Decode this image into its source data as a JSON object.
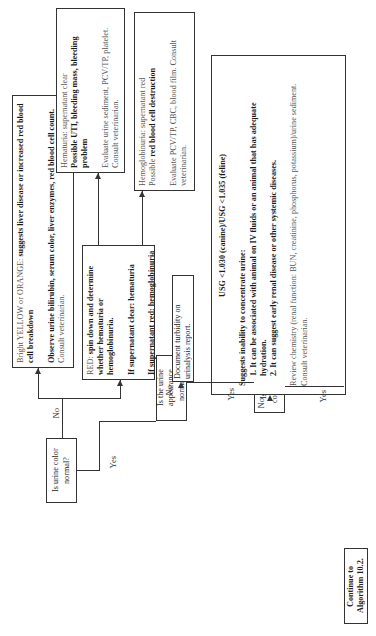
{
  "questions": {
    "q1": "Is urine color normal?",
    "q2": "Is the urine appearance normal?",
    "q3": "Is the urine concentrated?"
  },
  "labels": {
    "yes": "Yes",
    "no": "No"
  },
  "terminal": {
    "continue": "Continue to Algorithm 10.2."
  },
  "yellow_box": {
    "lead_plain": "Bright YELLOW or ORANGE: ",
    "lead_bold": "suggests liver disease or increased red blood cell breakdown",
    "action_bold": "Observe urine bilirubin, serum color, liver enzymes, red blood cell count.",
    "action_plain": " Consult veterinarian."
  },
  "red_box": {
    "lead_plain": "RED: ",
    "lead_bold": "spin down and determine whether hematuria or hemoglobinuria.",
    "clear": "If supernatant clear: hematuria",
    "red": "If supernatant red: hemoglobinuria"
  },
  "hematuria_box": {
    "line1": "Hematuria: supernatant clear",
    "line2_bold": "Possible UTI, bleeding mass, bleeding problem",
    "action": "Evaluate urine sediment, PCV/TP, platelet. Consult veterinarian."
  },
  "hemoglobinuria_box": {
    "line1": "Hemoglobinuria: supernatant red",
    "line2_plain": "Possible ",
    "line2_bold": "red blood cell destruction",
    "action": "Evaluate PCV/TP, CBC, blood film. Consult veterinarian."
  },
  "turbidity_box": {
    "text": "Document turbidity on urinalysis report."
  },
  "usg_box": {
    "title": "USG <1.030 (canine)/USG <1.035 (feline)",
    "intro": "Suggests inability to concentrate urine:",
    "point1": "1. It can be associated with animal on IV fluids or an animal that has adequate hydration.",
    "point2": "2. It can suggest early renal disease or other systemic diseases.",
    "action": "Review chemistry (renal function: BUN, creatinine, phosphorus, potassium)/urine sediment. Consult veterinarian."
  }
}
